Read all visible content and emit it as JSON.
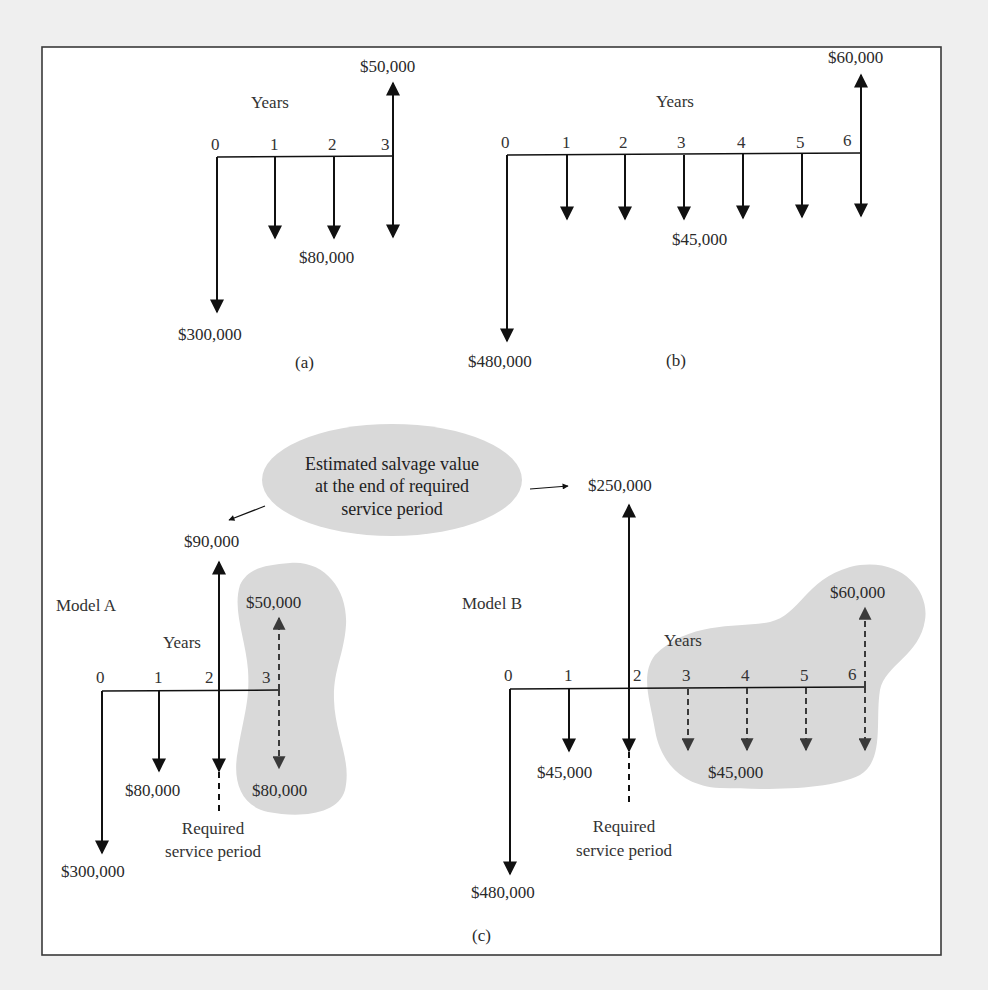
{
  "figure": {
    "colors": {
      "page_background": "#efefef",
      "frame_background": "#ffffff",
      "frame_border": "#3a3a3a",
      "arrow": "#111111",
      "dashed_arrow": "#333333",
      "highlight_fill": "#d9d9d9"
    },
    "panels": {
      "a": {
        "caption": "(a)",
        "axis_label": "Years",
        "ticks": [
          "0",
          "1",
          "2",
          "3"
        ],
        "labels": {
          "initial": "$300,000",
          "annual": "$80,000",
          "salvage": "$50,000"
        }
      },
      "b": {
        "caption": "(b)",
        "axis_label": "Years",
        "ticks": [
          "0",
          "1",
          "2",
          "3",
          "4",
          "5",
          "6"
        ],
        "labels": {
          "initial": "$480,000",
          "annual": "$45,000",
          "salvage": "$60,000"
        }
      },
      "c": {
        "caption": "(c)",
        "callout": {
          "lines": [
            "Estimated salvage value",
            "at the end of required",
            "service period"
          ]
        },
        "model_a": {
          "title": "Model A",
          "axis_label": "Years",
          "ticks": [
            "0",
            "1",
            "2",
            "3"
          ],
          "labels": {
            "initial": "$300,000",
            "annual": "$80,000",
            "salvage_at_2": "$90,000",
            "excluded_salvage": "$50,000",
            "excluded_annual": "$80,000"
          },
          "service_period_lines": [
            "Required",
            "service period"
          ]
        },
        "model_b": {
          "title": "Model B",
          "axis_label": "Years",
          "ticks": [
            "0",
            "1",
            "2",
            "3",
            "4",
            "5",
            "6"
          ],
          "labels": {
            "initial": "$480,000",
            "annual": "$45,000",
            "salvage_at_2": "$250,000",
            "excluded_salvage": "$60,000",
            "excluded_annual": "$45,000"
          },
          "service_period_lines": [
            "Required",
            "service period"
          ]
        }
      }
    }
  }
}
